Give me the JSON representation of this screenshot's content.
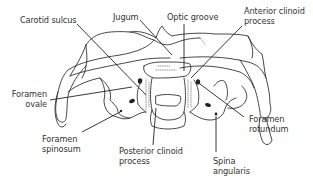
{
  "diagram": {
    "line_color": "#333333",
    "labels": {
      "carotid_sulcus": [
        "Carotid sulcus"
      ],
      "jugum": [
        "Jugum"
      ],
      "optic_groove": [
        "Optic groove"
      ],
      "anterior_clinoid_process": [
        "Anterior clinoid",
        "process"
      ],
      "foramen_ovale": [
        "Foramen",
        "ovale"
      ],
      "foramen_spinosum": [
        "Foramen",
        "spinosum"
      ],
      "posterior_clinoid_process": [
        "Posterior clinoid",
        "process"
      ],
      "foramen_rotundum": [
        "Foramen",
        "rotundum"
      ],
      "spina_angularis": [
        "Spina",
        "angularis"
      ]
    }
  }
}
